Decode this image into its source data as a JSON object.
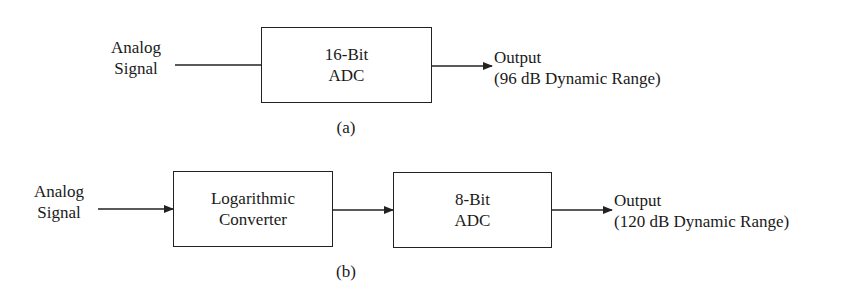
{
  "diagram_a": {
    "caption": "(a)",
    "input_label": [
      "Analog",
      "Signal"
    ],
    "blocks": [
      {
        "line1": "16-Bit",
        "line2": "ADC"
      }
    ],
    "output_label": [
      "Output",
      "(96 dB Dynamic Range)"
    ]
  },
  "diagram_b": {
    "caption": "(b)",
    "input_label": [
      "Analog",
      "Signal"
    ],
    "blocks": [
      {
        "line1": "Logarithmic",
        "line2": "Converter"
      },
      {
        "line1": "8-Bit",
        "line2": "ADC"
      }
    ],
    "output_label": [
      "Output",
      "(120 dB Dynamic Range)"
    ]
  },
  "colors": {
    "stroke": "#222222",
    "text": "#1a1a1a",
    "background": "#ffffff"
  }
}
